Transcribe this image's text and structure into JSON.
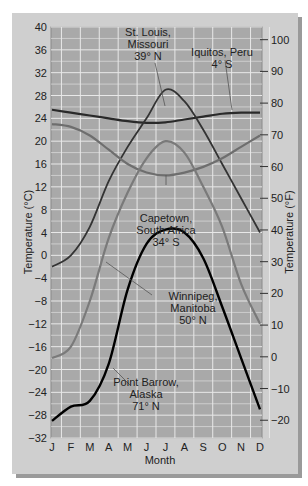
{
  "chart_data": {
    "type": "line",
    "title": "",
    "xlabel": "Month",
    "ylabel": "Temperature (°C)",
    "ylabel_right": "Temperature (°F)",
    "categories": [
      "J",
      "F",
      "M",
      "A",
      "M",
      "J",
      "J",
      "A",
      "S",
      "O",
      "N",
      "D"
    ],
    "ylim": [
      -32,
      40
    ],
    "yticks": [
      40,
      36,
      32,
      28,
      24,
      20,
      16,
      12,
      8,
      4,
      0,
      -4,
      -8,
      -12,
      -16,
      -20,
      -24,
      -28,
      -32
    ],
    "yticks_right_f": [
      100,
      90,
      80,
      70,
      60,
      50,
      40,
      30,
      20,
      10,
      0,
      -10,
      -20
    ],
    "grid": true,
    "series": [
      {
        "name": "Iquitos, Peru 4° S",
        "color": "#2a2a2a",
        "values": [
          25.5,
          25,
          24.5,
          24,
          23.5,
          23.2,
          23.3,
          23.8,
          24.3,
          24.8,
          25,
          25
        ]
      },
      {
        "name": "St. Louis, Missouri 39° N",
        "color": "#333333",
        "values": [
          -2,
          0,
          5,
          13,
          19,
          24,
          29,
          27,
          22,
          16,
          10,
          4
        ]
      },
      {
        "name": "Capetown, South Africa 34° S",
        "color": "#6e6e6e",
        "values": [
          23,
          22.5,
          21,
          18.5,
          16,
          14.5,
          14,
          14.5,
          15.5,
          17,
          19,
          21
        ]
      },
      {
        "name": "Winnipeg, Manitoba 50° N",
        "color": "#7a7a7a",
        "values": [
          -18,
          -16,
          -8,
          3,
          11,
          17,
          20,
          18,
          12,
          5,
          -5,
          -12
        ]
      },
      {
        "name": "Point Barrow, Alaska 71° N",
        "color": "#000000",
        "values": [
          -29,
          -26.5,
          -25.5,
          -19,
          -6,
          2,
          4.5,
          4,
          -0.5,
          -9,
          -18,
          -27
        ]
      }
    ],
    "annotations": [
      {
        "text": [
          "St. Louis,",
          "Missouri",
          "39° N"
        ]
      },
      {
        "text": [
          "Iquitos, Peru",
          "4° S"
        ]
      },
      {
        "text": [
          "Capetown,",
          "South Africa",
          "34° S"
        ]
      },
      {
        "text": [
          "Winnipeg,",
          "Manitoba",
          "50° N"
        ]
      },
      {
        "text": [
          "Point Barrow,",
          "Alaska",
          "71° N"
        ]
      }
    ]
  }
}
